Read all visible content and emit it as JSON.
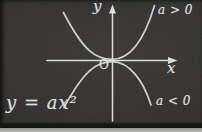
{
  "diagram": {
    "equation": "y = ax²",
    "y_axis_label": "y",
    "x_axis_label": "x",
    "origin_label": "O",
    "label_a_positive": "a > 0",
    "label_a_negative": "a < 0",
    "colors": {
      "board": "#2f2e2c",
      "chalk": "#dcdcd8",
      "photo_edge": "#121211",
      "bottom_strip": "#bbbbb8"
    }
  }
}
